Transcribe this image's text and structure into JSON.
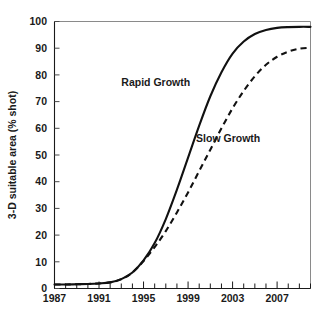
{
  "chart_data": {
    "type": "line",
    "title": "",
    "xlabel": "",
    "ylabel": "3-D suitable area (% shot)",
    "xlim": [
      1987,
      2010
    ],
    "ylim": [
      0,
      100
    ],
    "grid": false,
    "legend_position": "inline-annotation",
    "x_tick_labels": [
      "1987",
      "1991",
      "1995",
      "1999",
      "2003",
      "2007"
    ],
    "x_tick_values": [
      1987,
      1991,
      1995,
      1999,
      2003,
      2007
    ],
    "x_minor_tick_step": 1,
    "y_tick_labels": [
      "0",
      "10",
      "20",
      "30",
      "40",
      "50",
      "60",
      "70",
      "80",
      "90",
      "100"
    ],
    "y_tick_values": [
      0,
      10,
      20,
      30,
      40,
      50,
      60,
      70,
      80,
      90,
      100
    ],
    "x": [
      1987,
      1988,
      1989,
      1990,
      1991,
      1992,
      1993,
      1994,
      1995,
      1996,
      1997,
      1998,
      1999,
      2000,
      2001,
      2002,
      2003,
      2004,
      2005,
      2006,
      2007,
      2008,
      2009,
      2010
    ],
    "series": [
      {
        "name": "Rapid Growth",
        "style": "solid",
        "color": "#111111",
        "label_x": 1996.1,
        "label_y": 76,
        "values": [
          1.5,
          1.5,
          1.6,
          1.7,
          1.9,
          2.3,
          3.5,
          6.0,
          10.5,
          17.0,
          26.0,
          37.0,
          49.0,
          61.0,
          72.0,
          81.0,
          88.0,
          92.5,
          95.3,
          96.8,
          97.6,
          97.9,
          98.0,
          98.0
        ]
      },
      {
        "name": "Slow Growth",
        "style": "dashed",
        "color": "#111111",
        "label_x": 2002.6,
        "label_y": 55,
        "values": [
          1.5,
          1.5,
          1.6,
          1.7,
          1.9,
          2.3,
          3.5,
          6.0,
          10.3,
          15.5,
          21.5,
          28.5,
          36.0,
          44.0,
          52.0,
          60.0,
          67.5,
          74.0,
          79.5,
          83.8,
          86.8,
          88.7,
          89.8,
          90.2
        ]
      }
    ]
  },
  "axis": {
    "y_title": "3-D suitable area (% shot)"
  },
  "annotations": {
    "rapid_growth": "Rapid Growth",
    "slow_growth": "Slow Growth"
  },
  "colors": {
    "curve": "#111111",
    "frame": "#8a8a8a",
    "axis": "#1a1a1a",
    "background": "#ffffff"
  }
}
